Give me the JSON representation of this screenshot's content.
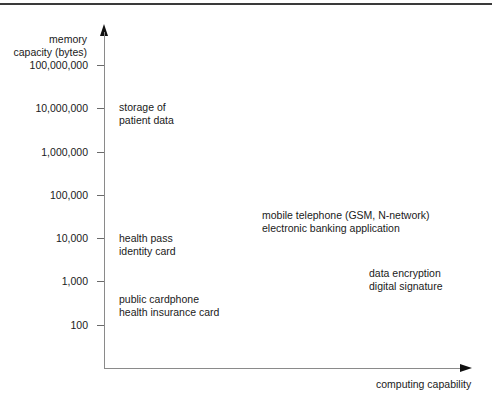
{
  "header": {
    "running_title": "SMART CARD HANDBOOK"
  },
  "axes": {
    "y_title_line1": "memory",
    "y_title_line2": "capacity (bytes)",
    "x_title": "computing capability",
    "y_ticks": [
      {
        "label": "100,000,000",
        "y": 65
      },
      {
        "label": "10,000,000",
        "y": 108
      },
      {
        "label": "1,000,000",
        "y": 152
      },
      {
        "label": "100,000",
        "y": 195
      },
      {
        "label": "10,000",
        "y": 238
      },
      {
        "label": "1,000",
        "y": 281
      },
      {
        "label": "100",
        "y": 325
      }
    ]
  },
  "annotations": [
    {
      "line1": "storage of",
      "line2": "patient data"
    },
    {
      "line1": "health pass",
      "line2": "identity card"
    },
    {
      "line1": "public cardphone",
      "line2": "health insurance card"
    },
    {
      "line1": "mobile telephone (GSM, N-network)",
      "line2": "electronic banking application"
    },
    {
      "line1": "data encryption",
      "line2": "digital signature"
    }
  ],
  "chart_data": {
    "type": "scatter",
    "title": "",
    "xlabel": "computing capability",
    "ylabel": "memory capacity (bytes)",
    "y_scale": "log",
    "y_ticks": [
      100,
      1000,
      10000,
      100000,
      1000000,
      10000000,
      100000000
    ],
    "points": [
      {
        "label": "storage of patient data",
        "x": "low",
        "y": 10000000
      },
      {
        "label": "health pass / identity card",
        "x": "low",
        "y": 7000
      },
      {
        "label": "public cardphone / health insurance card",
        "x": "low",
        "y": 400
      },
      {
        "label": "mobile telephone (GSM, N-network) / electronic banking application",
        "x": "medium",
        "y": 15000
      },
      {
        "label": "data encryption / digital signature",
        "x": "high",
        "y": 1500
      }
    ]
  }
}
